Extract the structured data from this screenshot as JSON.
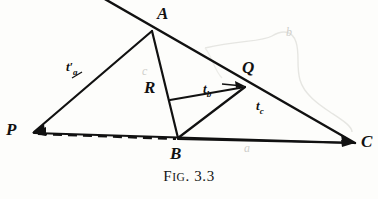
{
  "figure": {
    "caption_prefix": "F",
    "caption_smallcaps": "IG",
    "caption_suffix": ". 3.3",
    "caption_full": "FIG. 3.3",
    "ink_color": "#111111",
    "pencil_color": "#cfcfcb",
    "background_color": "#fdfdfb"
  },
  "vertices": {
    "A": {
      "label": "A",
      "x": 152,
      "y": 30,
      "label_x": 157,
      "label_y": 6
    },
    "P": {
      "label": "P",
      "x": 32,
      "y": 133,
      "label_x": 6,
      "label_y": 122
    },
    "B": {
      "label": "B",
      "x": 178,
      "y": 138,
      "label_x": 170,
      "label_y": 146
    },
    "C": {
      "label": "C",
      "x": 355,
      "y": 143,
      "label_x": 362,
      "label_y": 134
    },
    "Q": {
      "label": "Q",
      "x": 245,
      "y": 86,
      "label_x": 243,
      "label_y": 60
    },
    "R": {
      "label": "R",
      "x": 170,
      "y": 100,
      "label_x": 145,
      "label_y": 80
    }
  },
  "segment_labels": {
    "t_a_prime": {
      "base": "t",
      "sub": "a",
      "prime": "′",
      "x": 68,
      "y": 61
    },
    "t_b": {
      "base": "t",
      "sub": "b",
      "x": 205,
      "y": 84
    },
    "t_c": {
      "base": "t",
      "sub": "c",
      "x": 258,
      "y": 101
    }
  },
  "pencil_marks": {
    "c_near_R": {
      "text": "c",
      "x": 143,
      "y": 66
    },
    "a_near_BC": {
      "text": "a",
      "x": 245,
      "y": 143
    },
    "b_upper_right": {
      "text": "b",
      "x": 287,
      "y": 27
    }
  },
  "edges": [
    {
      "name": "line-through-A-to-C",
      "from": "top-edge",
      "to": "C",
      "style": "solid"
    },
    {
      "name": "edge-P-A",
      "from": "P",
      "to": "A",
      "style": "solid"
    },
    {
      "name": "edge-A-B",
      "from": "A",
      "to": "B",
      "style": "solid"
    },
    {
      "name": "edge-P-C",
      "from": "P",
      "to": "C",
      "style": "solid"
    },
    {
      "name": "edge-P-B-dashed",
      "from": "P",
      "to": "B",
      "style": "dashed"
    },
    {
      "name": "edge-B-C",
      "from": "B",
      "to": "C",
      "style": "solid"
    },
    {
      "name": "edge-R-Q",
      "from": "R",
      "to": "Q",
      "style": "solid"
    },
    {
      "name": "edge-B-Q",
      "from": "B",
      "to": "Q",
      "style": "solid"
    }
  ]
}
